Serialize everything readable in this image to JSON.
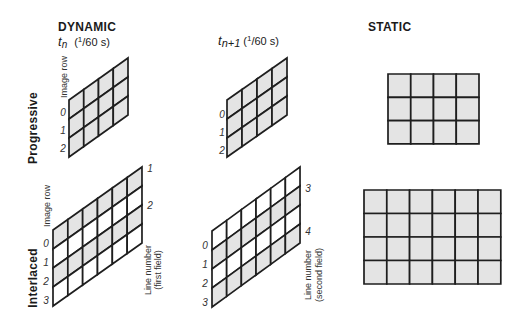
{
  "headings": {
    "dynamic": "DYNAMIC",
    "static": "STATIC"
  },
  "time_labels": [
    {
      "t": "t",
      "sub": "n",
      "paren_open": "(",
      "sup": "1",
      "rest": "/60 s)"
    },
    {
      "t": "t",
      "sub": "n+1",
      "paren_open": "(",
      "sup": "1",
      "rest": "/60 s)"
    }
  ],
  "row_labels": {
    "progressive": "Progressive",
    "interlaced": "Interlaced"
  },
  "axis_labels": {
    "image_row": "Image row",
    "line_number": "Line number",
    "first_field": "(first field)",
    "second_field": "(second field)"
  },
  "colors": {
    "shaded": "#e4e4e4",
    "blank": "#ffffff",
    "line": "#1e1e1e"
  },
  "grids": [
    {
      "name": "progressive-tn-grid",
      "cols": 4,
      "rows": 3,
      "shaded_rows": [
        0,
        1,
        2
      ],
      "row_indices": [
        "0",
        "1",
        "2"
      ]
    },
    {
      "name": "progressive-tn1-grid",
      "cols": 4,
      "rows": 3,
      "shaded_rows": [
        0,
        1,
        2
      ],
      "row_indices": [
        "0",
        "1",
        "2"
      ]
    },
    {
      "name": "progressive-static-grid",
      "cols": 4,
      "rows": 3,
      "shaded_rows": [
        0,
        1,
        2
      ]
    },
    {
      "name": "interlaced-tn-grid",
      "cols": 6,
      "rows": 4,
      "shaded_rows": [
        0,
        2
      ],
      "row_indices": [
        "0",
        "1",
        "2",
        "3"
      ],
      "line_numbers": [
        "1",
        "2"
      ]
    },
    {
      "name": "interlaced-tn1-grid",
      "cols": 6,
      "rows": 4,
      "shaded_rows": [
        1,
        3
      ],
      "row_indices": [
        "0",
        "1",
        "2",
        "3"
      ],
      "line_numbers": [
        "3",
        "4"
      ]
    },
    {
      "name": "interlaced-static-grid",
      "cols": 6,
      "rows": 4,
      "shaded_rows": [
        0,
        1,
        2,
        3
      ]
    }
  ]
}
